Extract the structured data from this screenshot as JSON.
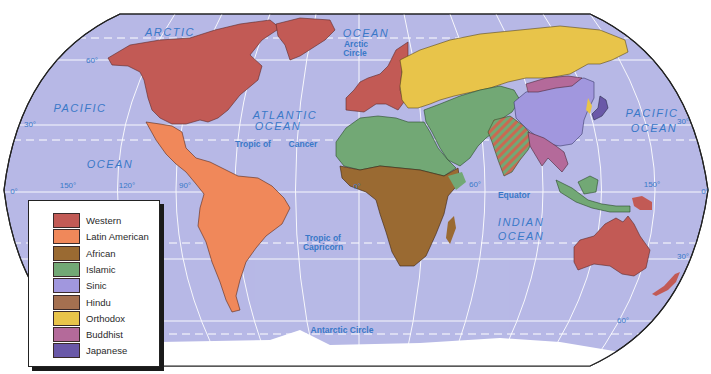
{
  "map": {
    "title": "Civilizations of the World",
    "projection": "Robinson",
    "ocean_color": "#b7b9e6",
    "colors": {
      "western": "#c25a55",
      "latin_american": "#f0885a",
      "african": "#9a6a32",
      "islamic": "#72a875",
      "sinic": "#a197de",
      "hindu": "#a57050",
      "orthodox": "#e8c44a",
      "buddhist": "#b46a9a",
      "japanese": "#6a58a8",
      "antarctica": "#ffffff"
    },
    "ocean_labels": [
      {
        "text": "ARCTIC",
        "x": 170,
        "y": 36
      },
      {
        "text": "OCEAN",
        "x": 366,
        "y": 37
      },
      {
        "text": "PACIFIC",
        "x": 80,
        "y": 112
      },
      {
        "text": "OCEAN",
        "x": 110,
        "y": 168
      },
      {
        "text": "ATLANTIC",
        "x": 285,
        "y": 119
      },
      {
        "text": "OCEAN",
        "x": 278,
        "y": 130
      },
      {
        "text": "PACIFIC",
        "x": 652,
        "y": 117
      },
      {
        "text": "OCEAN",
        "x": 654,
        "y": 132
      },
      {
        "text": "INDIAN",
        "x": 521,
        "y": 226
      },
      {
        "text": "OCEAN",
        "x": 521,
        "y": 240
      }
    ],
    "line_labels": [
      {
        "text": "Arctic",
        "x": 356,
        "y": 47
      },
      {
        "text": "Circle",
        "x": 355,
        "y": 56
      },
      {
        "text": "Tropic of",
        "x": 253,
        "y": 147
      },
      {
        "text": "Cancer",
        "x": 303,
        "y": 147
      },
      {
        "text": "Equator",
        "x": 514,
        "y": 198
      },
      {
        "text": "Tropic of",
        "x": 323,
        "y": 241
      },
      {
        "text": "Capricorn",
        "x": 323,
        "y": 250
      },
      {
        "text": "Antarctic Circle",
        "x": 342,
        "y": 333
      }
    ],
    "degree_labels": [
      {
        "text": "60°",
        "x": 92,
        "y": 63
      },
      {
        "text": "30°",
        "x": 30,
        "y": 127
      },
      {
        "text": "0°",
        "x": 14,
        "y": 194
      },
      {
        "text": "150°",
        "x": 68,
        "y": 188
      },
      {
        "text": "120°",
        "x": 127,
        "y": 188
      },
      {
        "text": "90°",
        "x": 185,
        "y": 188
      },
      {
        "text": "0°",
        "x": 357,
        "y": 189
      },
      {
        "text": "60°",
        "x": 475,
        "y": 187
      },
      {
        "text": "150°",
        "x": 652,
        "y": 187
      },
      {
        "text": "0°",
        "x": 705,
        "y": 194
      },
      {
        "text": "30°",
        "x": 683,
        "y": 124
      },
      {
        "text": "30°",
        "x": 683,
        "y": 259
      },
      {
        "text": "60°",
        "x": 623,
        "y": 323
      }
    ]
  },
  "legend": {
    "items": [
      {
        "label": "Western",
        "color": "#c25a55"
      },
      {
        "label": "Latin American",
        "color": "#f0885a"
      },
      {
        "label": "African",
        "color": "#9a6a32"
      },
      {
        "label": "Islamic",
        "color": "#72a875"
      },
      {
        "label": "Sinic",
        "color": "#a197de"
      },
      {
        "label": "Hindu",
        "color": "#a57050"
      },
      {
        "label": "Orthodox",
        "color": "#e8c44a"
      },
      {
        "label": "Buddhist",
        "color": "#b46a9a"
      },
      {
        "label": "Japanese",
        "color": "#6a58a8"
      }
    ]
  }
}
